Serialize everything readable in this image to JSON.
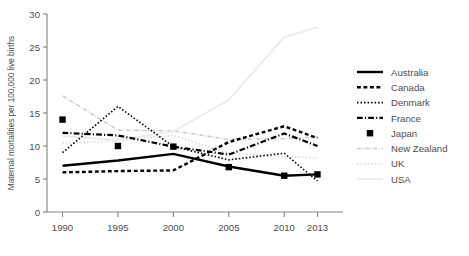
{
  "chart_data": {
    "type": "line",
    "title": "",
    "subtitle": "",
    "xlabel": "",
    "ylabel": "Maternal mortalities per 100,000 live births",
    "x": [
      1990,
      1995,
      2000,
      2005,
      2010,
      2013
    ],
    "categories": [
      "1990",
      "1995",
      "2000",
      "2005",
      "2010",
      "2013"
    ],
    "xtick_labels": [
      "1990",
      "1995",
      "2000",
      "2005",
      "2010",
      "2013"
    ],
    "ytick_labels": [
      "0",
      "5",
      "10",
      "15",
      "20",
      "25",
      "30"
    ],
    "yticks": [
      0,
      5,
      10,
      15,
      20,
      25,
      30
    ],
    "ylim": [
      0,
      30
    ],
    "xlim": [
      1988.6,
      2014.4
    ],
    "grid": false,
    "legend_position": "right",
    "series": [
      {
        "name": "Australia",
        "style": "solid",
        "color": "#000000",
        "width": 2.4,
        "marker": "none",
        "values": [
          7.0,
          7.8,
          8.8,
          6.9,
          5.5,
          5.7
        ]
      },
      {
        "name": "Canada",
        "style": "dashed",
        "color": "#000000",
        "width": 2.4,
        "marker": "none",
        "values": [
          6.0,
          6.2,
          6.3,
          10.6,
          13.0,
          11.2
        ]
      },
      {
        "name": "Denmark",
        "style": "dotted",
        "color": "#000000",
        "width": 1.6,
        "marker": "none",
        "values": [
          9.0,
          16.0,
          9.9,
          7.9,
          8.9,
          4.7
        ]
      },
      {
        "name": "France",
        "style": "dashdot",
        "color": "#000000",
        "width": 2.2,
        "marker": "none",
        "values": [
          12.0,
          11.6,
          9.9,
          8.7,
          11.9,
          10.0
        ]
      },
      {
        "name": "Japan",
        "style": "markers",
        "color": "#000000",
        "width": 0,
        "marker": "square",
        "values": [
          14.0,
          10.0,
          9.9,
          6.8,
          5.5,
          5.7
        ]
      },
      {
        "name": "New Zealand",
        "style": "dashdot",
        "color": "#cccccc",
        "width": 1.6,
        "marker": "none",
        "values": [
          17.6,
          12.4,
          12.3,
          11.0,
          11.1,
          11.4
        ]
      },
      {
        "name": "UK",
        "style": "dotted",
        "color": "#d9d9d9",
        "width": 1.6,
        "marker": "none",
        "values": [
          10.4,
          10.8,
          11.6,
          8.9,
          8.4,
          8.2
        ]
      },
      {
        "name": "USA",
        "style": "solid",
        "color": "#ebebeb",
        "width": 1.8,
        "marker": "none",
        "values": [
          11.5,
          10.9,
          12.2,
          17.0,
          26.5,
          28.0
        ]
      }
    ]
  },
  "legend": {
    "items": [
      {
        "label": "Australia"
      },
      {
        "label": "Canada"
      },
      {
        "label": "Denmark"
      },
      {
        "label": "France"
      },
      {
        "label": "Japan"
      },
      {
        "label": "New Zealand"
      },
      {
        "label": "UK"
      },
      {
        "label": "USA"
      }
    ]
  },
  "axes": {
    "y_axis_title": "Maternal mortalities per 100,000 live births"
  }
}
